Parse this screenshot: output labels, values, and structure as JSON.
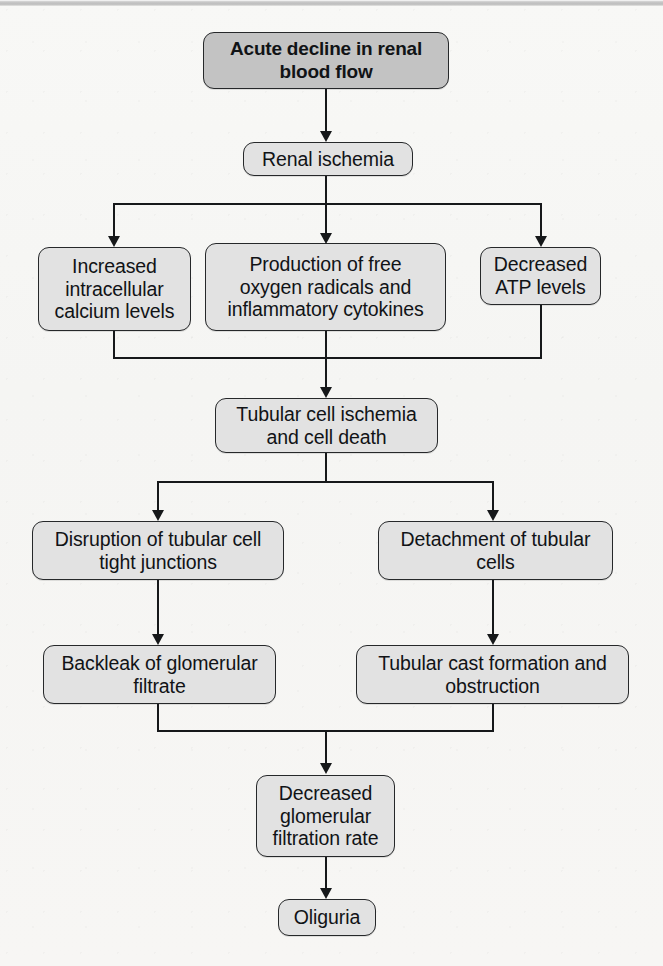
{
  "figure": {
    "type": "flowchart",
    "orientation": "top-to-bottom",
    "title_visible": false,
    "topbar": {
      "present": true,
      "color": "#c2c2c2"
    },
    "colors": {
      "page_background": "#f7f7f5",
      "node_fill": "#e2e2e2",
      "node_fill_emphasis": "#c3c3c3",
      "node_border": "#26282a",
      "connector": "#16181a",
      "text": "#111316"
    }
  },
  "nodes": [
    {
      "id": "n1",
      "label": "Acute decline in renal\nblood flow",
      "emphasis": true
    },
    {
      "id": "n2",
      "label": "Renal ischemia",
      "emphasis": false
    },
    {
      "id": "n3",
      "label": "Increased\nintracellular\ncalcium levels",
      "emphasis": false
    },
    {
      "id": "n4",
      "label": "Production of free\noxygen radicals and\ninflammatory cytokines",
      "emphasis": false
    },
    {
      "id": "n5",
      "label": "Decreased\nATP levels",
      "emphasis": false
    },
    {
      "id": "n6",
      "label": "Tubular cell ischemia\nand cell death",
      "emphasis": false
    },
    {
      "id": "n7",
      "label": "Disruption of tubular cell\ntight junctions",
      "emphasis": false
    },
    {
      "id": "n8",
      "label": "Detachment of tubular\ncells",
      "emphasis": false
    },
    {
      "id": "n9",
      "label": "Backleak of glomerular\nfiltrate",
      "emphasis": false
    },
    {
      "id": "n10",
      "label": "Tubular cast formation and\nobstruction",
      "emphasis": false
    },
    {
      "id": "n11",
      "label": "Decreased\nglomerular\nfiltration rate",
      "emphasis": false
    },
    {
      "id": "n12",
      "label": "Oliguria",
      "emphasis": false
    }
  ],
  "edges": [
    {
      "from": "n1",
      "to": "n2",
      "style": "straight-arrow"
    },
    {
      "from": "n2",
      "to": "n3",
      "style": "branch-left-arrow"
    },
    {
      "from": "n2",
      "to": "n4",
      "style": "straight-arrow"
    },
    {
      "from": "n2",
      "to": "n5",
      "style": "branch-right-arrow"
    },
    {
      "from": "n3",
      "to": "n6",
      "style": "merge-arrow"
    },
    {
      "from": "n4",
      "to": "n6",
      "style": "merge-arrow"
    },
    {
      "from": "n5",
      "to": "n6",
      "style": "merge-arrow"
    },
    {
      "from": "n6",
      "to": "n7",
      "style": "branch-left-arrow"
    },
    {
      "from": "n6",
      "to": "n8",
      "style": "branch-right-arrow"
    },
    {
      "from": "n7",
      "to": "n9",
      "style": "straight-arrow"
    },
    {
      "from": "n8",
      "to": "n10",
      "style": "straight-arrow"
    },
    {
      "from": "n9",
      "to": "n11",
      "style": "merge-arrow"
    },
    {
      "from": "n10",
      "to": "n11",
      "style": "merge-arrow"
    },
    {
      "from": "n11",
      "to": "n12",
      "style": "straight-arrow"
    }
  ]
}
